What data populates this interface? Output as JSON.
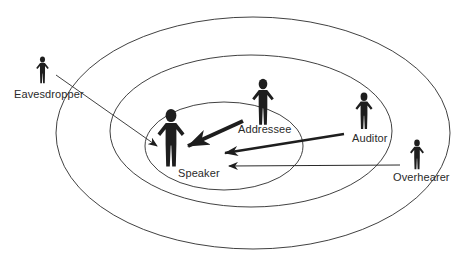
{
  "diagram": {
    "colors": {
      "ink": "#1e1e1e",
      "line": "#2b2b2b",
      "background": "#ffffff"
    },
    "zones": [
      {
        "name": "outer-zone",
        "cx": 253,
        "cy": 133,
        "rx": 197,
        "ry": 116
      },
      {
        "name": "middle-zone",
        "cx": 251,
        "cy": 131,
        "rx": 141,
        "ry": 76
      },
      {
        "name": "inner-zone",
        "cx": 224,
        "cy": 146,
        "rx": 79,
        "ry": 44
      }
    ],
    "roles": [
      {
        "id": "speaker",
        "label": "Speaker"
      },
      {
        "id": "addressee",
        "label": "Addressee"
      },
      {
        "id": "auditor",
        "label": "Auditor"
      },
      {
        "id": "overhearer",
        "label": "Overhearer"
      },
      {
        "id": "eavesdropper",
        "label": "Eavesdropper"
      }
    ],
    "arrows": [
      {
        "from": "eavesdropper",
        "to": "speaker",
        "weight": "thin"
      },
      {
        "from": "addressee",
        "to": "speaker",
        "weight": "thick"
      },
      {
        "from": "auditor",
        "to": "speaker",
        "weight": "medium"
      },
      {
        "from": "overhearer",
        "to": "speaker",
        "weight": "thin"
      }
    ]
  }
}
